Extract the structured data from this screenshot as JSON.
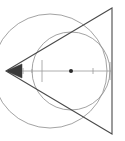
{
  "figure": {
    "type": "geometry-diagram",
    "canvas": {
      "width": 125,
      "height": 141,
      "background": "#ffffff"
    },
    "colors": {
      "triangle_stroke": "#4a4a4a",
      "outer_circle_stroke": "#8c8c8c",
      "inner_circle_stroke": "#8c8c8c",
      "axis_stroke": "#9a9a9a",
      "marker_fill": "#2b2b2b"
    },
    "stroke_widths": {
      "triangle": 1.1,
      "outer_circle": 0.8,
      "inner_circle": 0.8,
      "axis": 0.8
    },
    "triangle": {
      "label": "isoceles-triangle",
      "vertices": [
        {
          "name": "apex-left",
          "x": 6,
          "y": 71
        },
        {
          "name": "vertex-top-right",
          "x": 112,
          "y": 8
        },
        {
          "name": "vertex-bottom-right",
          "x": 112,
          "y": 134
        }
      ]
    },
    "outer_circle": {
      "label": "outer-circle",
      "cx": 50,
      "cy": 71,
      "r": 57
    },
    "inner_circle": {
      "label": "inner-circle",
      "cx": 71,
      "cy": 71,
      "r": 39
    },
    "axis": {
      "label": "horizontal-axis",
      "y": 71,
      "x_start": 6,
      "x_end": 112,
      "arrowhead": {
        "name": "left-arrowhead",
        "tip_x": 6,
        "tail_x": 22,
        "half_height": 7
      },
      "end_caps": [
        {
          "name": "cap-left",
          "x": 42,
          "y_top": 60,
          "y_bottom": 82
        },
        {
          "name": "cap-right",
          "x": 110,
          "y_top": 62,
          "y_bottom": 80
        }
      ],
      "tick_marks": [
        {
          "name": "tick-1",
          "x": 23,
          "half_height": 3
        },
        {
          "name": "tick-2",
          "x": 32,
          "half_height": 2
        },
        {
          "name": "tick-3",
          "x": 93,
          "half_height": 3
        }
      ],
      "center_dot": {
        "name": "center-point",
        "x": 71,
        "y": 71,
        "r": 2
      }
    }
  }
}
